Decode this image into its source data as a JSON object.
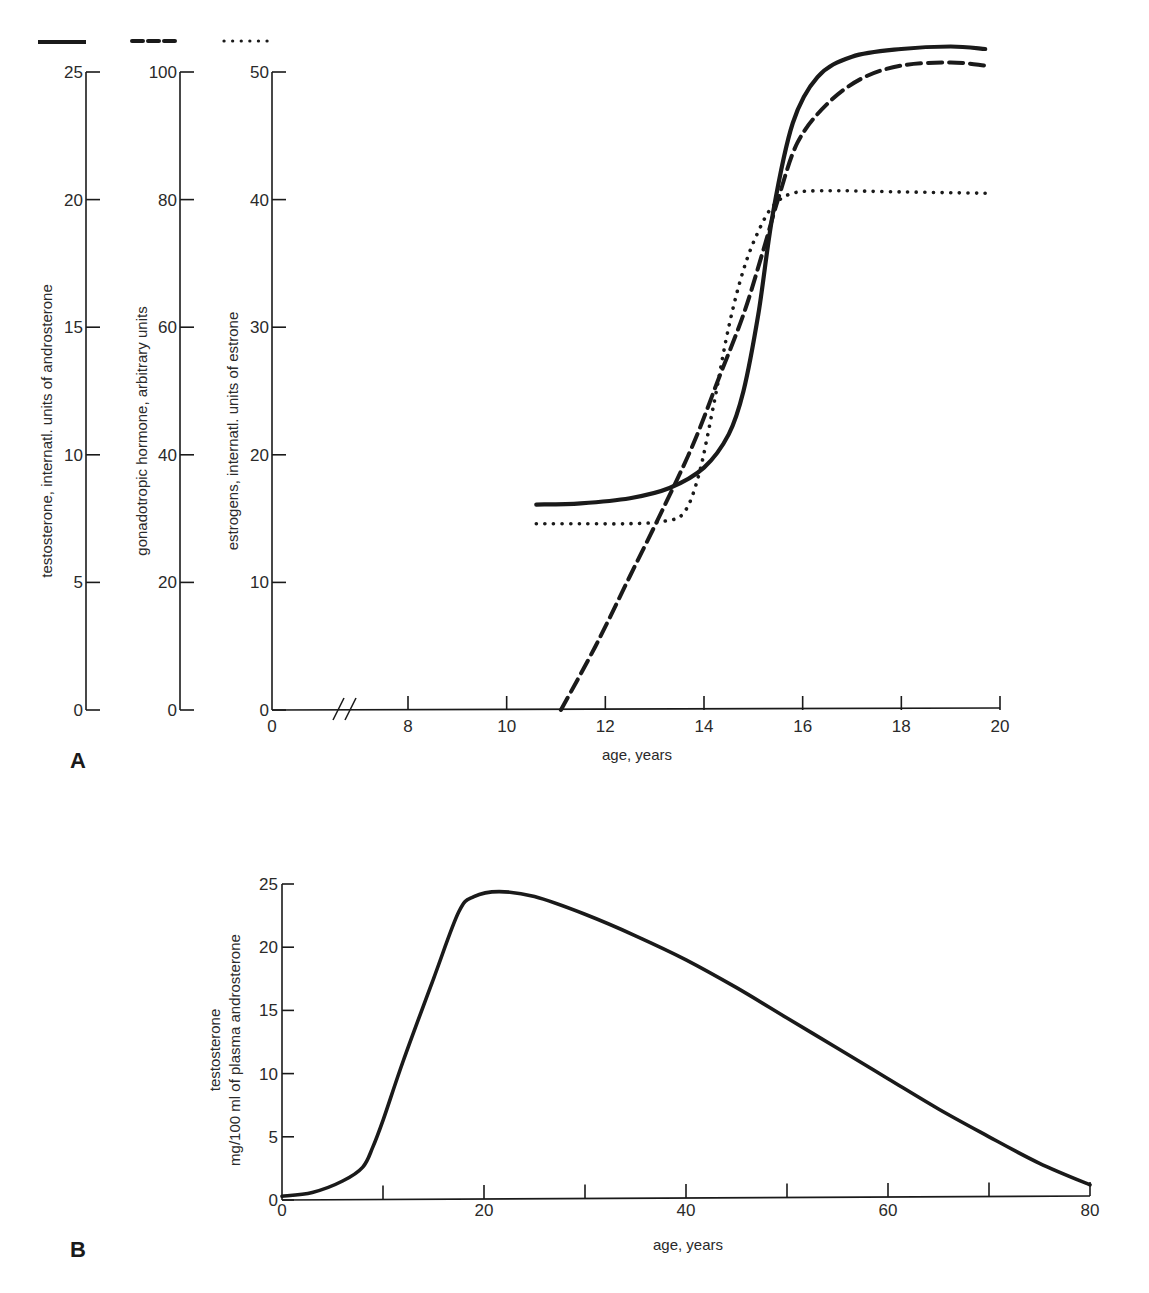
{
  "chart_data": [
    {
      "panel": "A",
      "type": "line",
      "xlabel": "age, years",
      "x_ticks": [
        0,
        8,
        10,
        12,
        14,
        16,
        18,
        20
      ],
      "x_axis_break": "between 0 and 8",
      "xlim": [
        0,
        20
      ],
      "grid": false,
      "legend": "line-style swatches above each y-axis (solid, dashed, dotted)",
      "axes": [
        {
          "id": "testosterone",
          "label": "testosterone, internatl. units of androsterone",
          "ticks": [
            0,
            5,
            10,
            15,
            20,
            25
          ],
          "ylim": [
            0,
            25
          ],
          "line_style": "solid"
        },
        {
          "id": "gonadotropic",
          "label": "gonadotropic hormone, arbitrary units",
          "ticks": [
            0,
            20,
            40,
            60,
            80,
            100
          ],
          "ylim": [
            0,
            100
          ],
          "line_style": "dashed"
        },
        {
          "id": "estrogens",
          "label": "estrogens, internatl. units of estrone",
          "ticks": [
            0,
            10,
            20,
            30,
            40,
            50
          ],
          "ylim": [
            0,
            50
          ],
          "line_style": "dotted"
        }
      ],
      "series": [
        {
          "name": "testosterone",
          "axis": "testosterone",
          "style": "solid",
          "x": [
            10.6,
            11.5,
            12.5,
            13.3,
            14.0,
            14.5,
            14.8,
            15.1,
            15.4,
            15.8,
            16.3,
            17.0,
            18.0,
            19.0,
            19.7
          ],
          "y": [
            8.05,
            8.1,
            8.3,
            8.7,
            9.5,
            10.8,
            12.5,
            15.5,
            19.5,
            23.0,
            24.8,
            25.6,
            25.9,
            26.0,
            25.9
          ]
        },
        {
          "name": "gonadotropic hormone",
          "axis": "gonadotropic",
          "style": "dashed",
          "x": [
            11.1,
            11.8,
            12.5,
            13.2,
            13.8,
            14.3,
            14.8,
            15.2,
            15.5,
            15.9,
            16.5,
            17.2,
            18.0,
            19.0,
            19.7
          ],
          "y": [
            0,
            10,
            21,
            32,
            42,
            52,
            62,
            72,
            80,
            89,
            95,
            99,
            101,
            101.5,
            101
          ]
        },
        {
          "name": "estrogens",
          "axis": "estrogens",
          "style": "dotted",
          "x": [
            10.6,
            11.5,
            12.5,
            13.2,
            13.6,
            13.9,
            14.2,
            14.5,
            14.8,
            15.1,
            15.4,
            15.8,
            16.5,
            18.0,
            19.7
          ],
          "y": [
            14.6,
            14.6,
            14.6,
            14.8,
            15.5,
            18.5,
            24,
            30,
            34.5,
            37.5,
            39.5,
            40.5,
            40.7,
            40.6,
            40.5
          ]
        }
      ]
    },
    {
      "panel": "B",
      "type": "line",
      "xlabel": "age, years",
      "ylabel": "testosterone mg/100 ml of plasma androsterone",
      "x_ticks": [
        0,
        10,
        20,
        30,
        40,
        50,
        60,
        70,
        80
      ],
      "x_tick_labels": [
        "0",
        "",
        "20",
        "",
        "40",
        "",
        "60",
        "",
        "80"
      ],
      "y_ticks": [
        0,
        5,
        10,
        15,
        20,
        25
      ],
      "xlim": [
        0,
        80
      ],
      "ylim": [
        0,
        25
      ],
      "grid": false,
      "series": [
        {
          "name": "testosterone",
          "style": "solid",
          "x": [
            0,
            3,
            6,
            8,
            9,
            10,
            12,
            15,
            17.5,
            19,
            21.5,
            25,
            30,
            35,
            40,
            45,
            50,
            55,
            60,
            65,
            70,
            75,
            80
          ],
          "y": [
            0.3,
            0.6,
            1.5,
            2.6,
            4.2,
            6.3,
            11,
            17.5,
            22.8,
            24.0,
            24.4,
            24.0,
            22.6,
            20.9,
            19.0,
            16.8,
            14.4,
            12.0,
            9.6,
            7.2,
            5.0,
            2.9,
            1.2
          ]
        }
      ]
    }
  ],
  "labels": {
    "panel_a": "A",
    "panel_b": "B",
    "a_xlabel": "age, years",
    "b_xlabel": "age, years",
    "a_axis1_label": "testosterone, internatl. units of androsterone",
    "a_axis2_label": "gonadotropic hormone, arbitrary units",
    "a_axis3_label": "estrogens, internatl. units of estrone",
    "b_ylabel_line1": "testosterone",
    "b_ylabel_line2": "mg/100 ml of plasma androsterone"
  },
  "colors": {
    "ink": "#1a1a1a",
    "background": "#ffffff"
  }
}
